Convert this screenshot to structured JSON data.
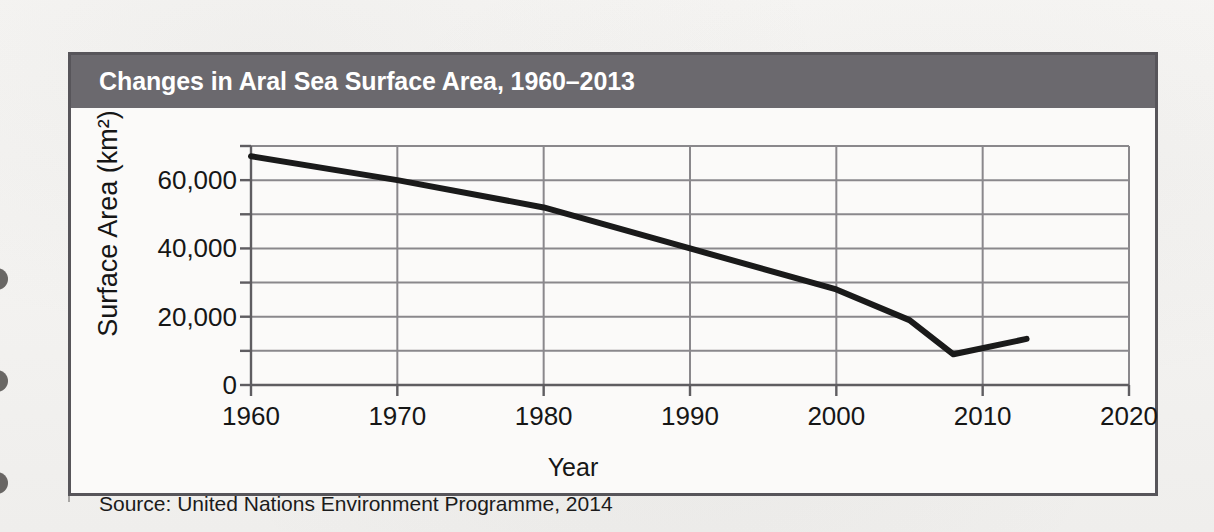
{
  "figure": {
    "title": "Changes in Aral Sea Surface Area, 1960–2013",
    "source": "Source: United Nations Environment Programme, 2014",
    "header_color": "#6b696e",
    "border_color": "#57555a",
    "line_color": "#1a1a1a",
    "grid_color": "#8a888c"
  },
  "chart_data": {
    "type": "line",
    "title": "Changes in Aral Sea Surface Area, 1960–2013",
    "xlabel": "Year",
    "ylabel": "Surface Area (km²)",
    "xlim": [
      1960,
      2020
    ],
    "ylim": [
      0,
      70000
    ],
    "xticks": [
      1960,
      1970,
      1980,
      1990,
      2000,
      2010,
      2020
    ],
    "xtick_labels": [
      "1960",
      "1970",
      "1980",
      "1990",
      "2000",
      "2010",
      "2020"
    ],
    "yticks": [
      0,
      10000,
      20000,
      30000,
      40000,
      50000,
      60000,
      70000
    ],
    "ytick_labels": [
      "0",
      "",
      "20,000",
      "",
      "40,000",
      "",
      "60,000",
      ""
    ],
    "grid": true,
    "grid_axis": "both",
    "legend": false,
    "series": [
      {
        "name": "Aral Sea surface area",
        "x": [
          1960,
          1970,
          1980,
          1990,
          2000,
          2005,
          2008,
          2013
        ],
        "values": [
          67000,
          60000,
          52000,
          40000,
          28000,
          19000,
          9000,
          13500
        ]
      }
    ],
    "annotations": [
      "Source: United Nations Environment Programme, 2014"
    ]
  }
}
